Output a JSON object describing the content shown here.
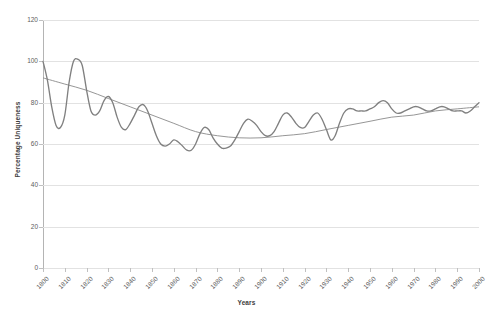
{
  "chart_data": {
    "type": "line",
    "title": "",
    "xlabel": "Years",
    "ylabel": "Percentage Uniqueness",
    "xlim": [
      1800,
      2000
    ],
    "ylim": [
      0,
      120
    ],
    "grid": true,
    "legend": "none",
    "y_ticks": [
      0,
      20,
      40,
      60,
      80,
      100,
      120
    ],
    "x_ticks": [
      1800,
      1810,
      1820,
      1830,
      1840,
      1850,
      1860,
      1870,
      1880,
      1890,
      1900,
      1910,
      1920,
      1930,
      1940,
      1950,
      1960,
      1970,
      1980,
      1990,
      2000
    ],
    "line_color": "#808080",
    "trend_color": "#8a8a8a",
    "grid_color": "#e2e2e2",
    "series": [
      {
        "name": "Percentage Uniqueness",
        "x": [
          1800,
          1802,
          1804,
          1806,
          1808,
          1810,
          1812,
          1814,
          1816,
          1818,
          1820,
          1822,
          1824,
          1826,
          1828,
          1830,
          1832,
          1834,
          1836,
          1838,
          1840,
          1842,
          1844,
          1846,
          1848,
          1850,
          1852,
          1854,
          1856,
          1858,
          1860,
          1862,
          1864,
          1866,
          1868,
          1870,
          1872,
          1874,
          1876,
          1878,
          1880,
          1882,
          1884,
          1886,
          1888,
          1890,
          1892,
          1894,
          1896,
          1898,
          1900,
          1902,
          1904,
          1906,
          1908,
          1910,
          1912,
          1914,
          1916,
          1918,
          1920,
          1922,
          1924,
          1926,
          1928,
          1930,
          1932,
          1934,
          1936,
          1938,
          1940,
          1942,
          1944,
          1946,
          1948,
          1950,
          1952,
          1954,
          1956,
          1958,
          1960,
          1962,
          1964,
          1966,
          1968,
          1970,
          1972,
          1974,
          1976,
          1978,
          1980,
          1982,
          1984,
          1986,
          1988,
          1990,
          1992,
          1994,
          1996,
          1998,
          2000
        ],
        "values": [
          100,
          91,
          78,
          69,
          68,
          74,
          90,
          100,
          101,
          98,
          86,
          76,
          74,
          76,
          81,
          83,
          80,
          73,
          68,
          67,
          70,
          74,
          78,
          79,
          76,
          70,
          64,
          60,
          59,
          60,
          62,
          61,
          59,
          57,
          57,
          60,
          65,
          68,
          67,
          63,
          60,
          58,
          58,
          59,
          62,
          66,
          70,
          72,
          71,
          69,
          66,
          64,
          64,
          66,
          70,
          74,
          75,
          73,
          70,
          68,
          68,
          71,
          74,
          75,
          72,
          67,
          62,
          64,
          70,
          75,
          77,
          77,
          76,
          76,
          76,
          77,
          78,
          80,
          81,
          80,
          77,
          75,
          75,
          76,
          77,
          78,
          78,
          77,
          76,
          76,
          77,
          78,
          78,
          77,
          76,
          76,
          76,
          75,
          76,
          78,
          80
        ]
      },
      {
        "name": "Trend (polynomial)",
        "x": [
          1800,
          1810,
          1820,
          1830,
          1840,
          1850,
          1860,
          1870,
          1880,
          1890,
          1900,
          1910,
          1920,
          1930,
          1940,
          1950,
          1960,
          1970,
          1980,
          1990,
          2000
        ],
        "values": [
          92,
          89,
          86,
          82,
          78,
          74,
          70,
          66,
          64,
          63,
          63,
          64,
          65,
          67,
          69,
          71,
          73,
          74,
          76,
          77,
          78
        ]
      }
    ]
  }
}
